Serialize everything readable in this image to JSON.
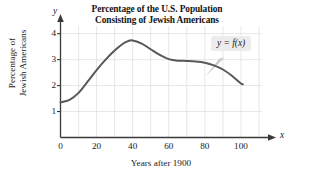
{
  "chart_data": {
    "type": "line",
    "title": "Percentage of the U.S. Population Consisting of Jewish Americans",
    "title_line1": "Percentage of the U.S. Population",
    "title_line2": "Consisting of Jewish Americans",
    "xlabel": "Years after 1900",
    "ylabel": "Percentage of Jewish Americans",
    "ylabel_line1": "Percentage of",
    "ylabel_line2": "Jewish Americans",
    "x_axis_variable": "x",
    "y_axis_variable": "y",
    "xlim": [
      0,
      115
    ],
    "ylim": [
      0,
      4.45
    ],
    "xticks": [
      0,
      20,
      40,
      60,
      80,
      100
    ],
    "xtick_labels": [
      "0",
      "20",
      "40",
      "60",
      "80",
      "100"
    ],
    "yticks": [
      1,
      2,
      3,
      4
    ],
    "ytick_labels": [
      "1",
      "2",
      "3",
      "4"
    ],
    "grid": true,
    "grid_spacing_x": 10,
    "grid_spacing_y": 1,
    "legend": "y = f(x)",
    "legend_position": "upper-right-callout",
    "series": [
      {
        "name": "y = f(x)",
        "color": "#58585a",
        "x": [
          0,
          5,
          10,
          15,
          20,
          25,
          30,
          35,
          38,
          40,
          45,
          50,
          55,
          60,
          65,
          70,
          75,
          80,
          85,
          90,
          95,
          100,
          101
        ],
        "values": [
          1.35,
          1.45,
          1.72,
          2.15,
          2.6,
          3.0,
          3.35,
          3.63,
          3.73,
          3.74,
          3.62,
          3.4,
          3.18,
          3.02,
          2.96,
          2.95,
          2.93,
          2.88,
          2.78,
          2.62,
          2.38,
          2.08,
          2.05
        ]
      }
    ]
  }
}
